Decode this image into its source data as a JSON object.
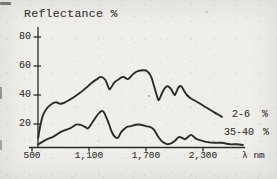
{
  "page": {
    "paper_color": "#efeeeb",
    "ink_color": "#2b2b27",
    "text_color": "#343430"
  },
  "chart": {
    "title": "Reflectance %",
    "x_unit": "λ nm",
    "series_labels": [
      {
        "range": "2-6",
        "unit": "%"
      },
      {
        "range": "35-40",
        "unit": "%"
      }
    ]
  },
  "chart_data": {
    "type": "line",
    "title": "Reflectance %",
    "xlabel": "λ nm",
    "ylabel": "Reflectance %",
    "x_key": "wavelength_nm",
    "y_key": "reflectance_percent",
    "xlim": [
      500,
      2740
    ],
    "ylim": [
      0,
      87
    ],
    "grid": false,
    "legend_position": "inline-right",
    "legend": [
      "2-6 %",
      "35-40 %"
    ],
    "x_ticks": [
      {
        "label": "500",
        "value": 500
      },
      {
        "label": "1,100",
        "value": 1100
      },
      {
        "label": "1,700",
        "value": 1700
      },
      {
        "label": "2,300",
        "value": 2300
      }
    ],
    "y_ticks": [
      {
        "label": "80",
        "value": 80
      },
      {
        "label": "60",
        "value": 60
      },
      {
        "label": "40",
        "value": 40
      },
      {
        "label": "20",
        "value": 20
      }
    ],
    "series": [
      {
        "name": "2-6 %",
        "points": [
          [
            565,
            10.5
          ],
          [
            585,
            18
          ],
          [
            615,
            26
          ],
          [
            660,
            31
          ],
          [
            710,
            34
          ],
          [
            755,
            35
          ],
          [
            795,
            34
          ],
          [
            835,
            34.5
          ],
          [
            890,
            36.5
          ],
          [
            940,
            38.5
          ],
          [
            1005,
            41.5
          ],
          [
            1070,
            45
          ],
          [
            1130,
            48.5
          ],
          [
            1185,
            51
          ],
          [
            1225,
            52.5
          ],
          [
            1270,
            50.5
          ],
          [
            1300,
            46
          ],
          [
            1320,
            44
          ],
          [
            1365,
            48.5
          ],
          [
            1405,
            50.5
          ],
          [
            1460,
            52.5
          ],
          [
            1510,
            51
          ],
          [
            1565,
            54.5
          ],
          [
            1615,
            56.5
          ],
          [
            1670,
            57
          ],
          [
            1710,
            56.5
          ],
          [
            1755,
            52.5
          ],
          [
            1785,
            46
          ],
          [
            1815,
            39.5
          ],
          [
            1835,
            36.5
          ],
          [
            1870,
            41.5
          ],
          [
            1900,
            45
          ],
          [
            1930,
            46
          ],
          [
            1965,
            44
          ],
          [
            1985,
            41.5
          ],
          [
            2005,
            40
          ],
          [
            2025,
            43
          ],
          [
            2045,
            45.5
          ],
          [
            2070,
            46
          ],
          [
            2100,
            43
          ],
          [
            2130,
            40
          ],
          [
            2165,
            38
          ],
          [
            2215,
            36
          ],
          [
            2270,
            34
          ],
          [
            2330,
            31.5
          ],
          [
            2395,
            29
          ],
          [
            2445,
            27
          ],
          [
            2500,
            25
          ]
        ]
      },
      {
        "name": "35-40 %",
        "points": [
          [
            565,
            6
          ],
          [
            645,
            9
          ],
          [
            730,
            11.5
          ],
          [
            815,
            15
          ],
          [
            900,
            17
          ],
          [
            965,
            19.5
          ],
          [
            1005,
            19.5
          ],
          [
            1060,
            18
          ],
          [
            1090,
            17
          ],
          [
            1130,
            20.5
          ],
          [
            1165,
            24
          ],
          [
            1205,
            27.5
          ],
          [
            1245,
            29
          ],
          [
            1280,
            25
          ],
          [
            1310,
            20
          ],
          [
            1340,
            14.5
          ],
          [
            1375,
            11
          ],
          [
            1405,
            10.5
          ],
          [
            1435,
            14
          ],
          [
            1470,
            16.5
          ],
          [
            1500,
            18
          ],
          [
            1540,
            18.5
          ],
          [
            1595,
            19.5
          ],
          [
            1645,
            19.5
          ],
          [
            1700,
            18.5
          ],
          [
            1740,
            18
          ],
          [
            1785,
            16
          ],
          [
            1825,
            11.5
          ],
          [
            1860,
            8.5
          ],
          [
            1890,
            7
          ],
          [
            1930,
            6
          ],
          [
            1975,
            7
          ],
          [
            2015,
            9
          ],
          [
            2045,
            11
          ],
          [
            2080,
            10.5
          ],
          [
            2110,
            9.5
          ],
          [
            2140,
            11
          ],
          [
            2175,
            12.5
          ],
          [
            2205,
            11
          ],
          [
            2235,
            9.5
          ],
          [
            2290,
            8.5
          ],
          [
            2350,
            7.5
          ],
          [
            2425,
            7
          ],
          [
            2500,
            7
          ],
          [
            2585,
            6
          ],
          [
            2660,
            6
          ],
          [
            2720,
            5.5
          ]
        ]
      }
    ]
  }
}
